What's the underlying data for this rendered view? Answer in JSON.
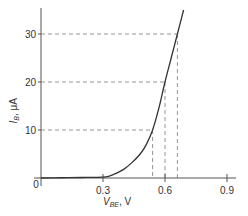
{
  "chart_data": {
    "type": "line",
    "title": "",
    "xlabel": {
      "main": "V",
      "sub": "BE",
      "unit": ", V"
    },
    "ylabel": {
      "main": "I",
      "sub": "B",
      "unit": ", μA"
    },
    "xlim": [
      0,
      0.95
    ],
    "ylim": [
      0,
      36
    ],
    "x_ticks": [
      0.3,
      0.6,
      0.9
    ],
    "x_tick_labels": [
      "0.3",
      "0.6",
      "0.9"
    ],
    "y_ticks": [
      10,
      20,
      30
    ],
    "y_tick_labels": [
      "10",
      "20",
      "30"
    ],
    "origin_label": "0",
    "grid": false,
    "series": [
      {
        "name": "I_B vs V_BE",
        "x": [
          0.0,
          0.1,
          0.2,
          0.3,
          0.33,
          0.36,
          0.4,
          0.44,
          0.48,
          0.51,
          0.54,
          0.57,
          0.6,
          0.63,
          0.66,
          0.69
        ],
        "y": [
          0.0,
          0.05,
          0.1,
          0.2,
          0.4,
          0.9,
          1.8,
          3.2,
          5.0,
          7.0,
          10.0,
          14.5,
          20.0,
          25.0,
          30.0,
          35.0
        ]
      }
    ],
    "reference_lines": [
      {
        "y": 10,
        "x": 0.54
      },
      {
        "y": 20,
        "x": 0.6
      },
      {
        "y": 30,
        "x": 0.66
      }
    ]
  }
}
